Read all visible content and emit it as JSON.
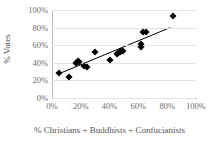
{
  "chart_data": {
    "type": "scatter",
    "title": "",
    "xlabel": "% Christians + Buddhists + Confucianists",
    "ylabel": "% Votes",
    "xlim": [
      0,
      100
    ],
    "ylim": [
      0,
      100
    ],
    "grid": "horizontal",
    "legend": "none",
    "x_tick_labels": [
      "0%",
      "20%",
      "40%",
      "60%",
      "80%",
      "100%"
    ],
    "x_tick_values": [
      0,
      20,
      40,
      60,
      80,
      100
    ],
    "y_tick_labels": [
      "0%",
      "20%",
      "40%",
      "60%",
      "80%",
      "100%"
    ],
    "y_tick_values": [
      0,
      20,
      40,
      60,
      80,
      100
    ],
    "marker_style": "filled-diamond",
    "marker_color": "#000000",
    "trendline": {
      "color": "#000000",
      "x_start": 4,
      "y_start": 27,
      "x_end": 82,
      "y_end": 80
    },
    "points": [
      {
        "x": 5,
        "y": 28
      },
      {
        "x": 12,
        "y": 24
      },
      {
        "x": 17,
        "y": 40
      },
      {
        "x": 18,
        "y": 42
      },
      {
        "x": 19,
        "y": 41
      },
      {
        "x": 22,
        "y": 36
      },
      {
        "x": 24,
        "y": 35
      },
      {
        "x": 30,
        "y": 52
      },
      {
        "x": 40,
        "y": 43
      },
      {
        "x": 45,
        "y": 50
      },
      {
        "x": 46,
        "y": 51
      },
      {
        "x": 47,
        "y": 52
      },
      {
        "x": 48,
        "y": 53
      },
      {
        "x": 49,
        "y": 53
      },
      {
        "x": 62,
        "y": 58
      },
      {
        "x": 62,
        "y": 61
      },
      {
        "x": 63,
        "y": 75
      },
      {
        "x": 65,
        "y": 75
      },
      {
        "x": 84,
        "y": 93
      }
    ]
  }
}
